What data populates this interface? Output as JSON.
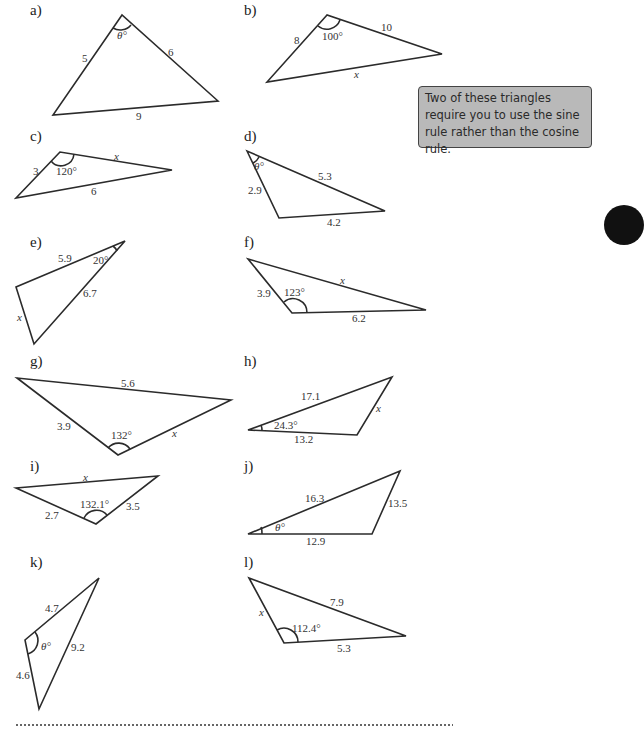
{
  "note": {
    "text": "Two of these triangles require you to use the sine rule rather than the cosine rule."
  },
  "triangles": [
    {
      "id": "a",
      "label": "a)",
      "sides": [
        "5",
        "6",
        "9"
      ],
      "angle": "θ°"
    },
    {
      "id": "b",
      "label": "b)",
      "sides": [
        "8",
        "10",
        "x"
      ],
      "angle": "100°"
    },
    {
      "id": "c",
      "label": "c)",
      "sides": [
        "3",
        "x",
        "6"
      ],
      "angle": "120°"
    },
    {
      "id": "d",
      "label": "d)",
      "sides": [
        "2.9",
        "5.3",
        "4.2"
      ],
      "angle": "θ°"
    },
    {
      "id": "e",
      "label": "e)",
      "sides": [
        "5.9",
        "6.7",
        "x"
      ],
      "angle": "20°"
    },
    {
      "id": "f",
      "label": "f)",
      "sides": [
        "3.9",
        "x",
        "6.2"
      ],
      "angle": "123°"
    },
    {
      "id": "g",
      "label": "g)",
      "sides": [
        "5.6",
        "3.9",
        "x"
      ],
      "angle": "132°"
    },
    {
      "id": "h",
      "label": "h)",
      "sides": [
        "17.1",
        "13.2",
        "x"
      ],
      "angle": "24.3°"
    },
    {
      "id": "i",
      "label": "i)",
      "sides": [
        "x",
        "2.7",
        "3.5"
      ],
      "angle": "132.1°"
    },
    {
      "id": "j",
      "label": "j)",
      "sides": [
        "16.3",
        "12.9",
        "13.5"
      ],
      "angle": "θ°"
    },
    {
      "id": "k",
      "label": "k)",
      "sides": [
        "4.7",
        "9.2",
        "4.6"
      ],
      "angle": "θ°"
    },
    {
      "id": "l",
      "label": "l)",
      "sides": [
        "x",
        "7.9",
        "5.3"
      ],
      "angle": "112.4°"
    }
  ]
}
